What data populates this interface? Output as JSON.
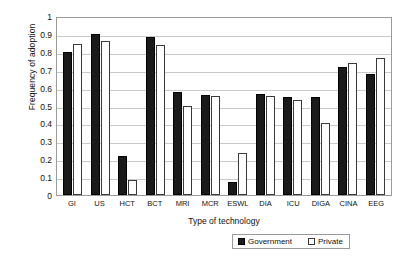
{
  "chart_data": {
    "type": "bar",
    "title": "",
    "xlabel": "Type of technology",
    "ylabel": "Frequency of adoption",
    "ylim": [
      0,
      1
    ],
    "ytick_labels": [
      "1",
      "0.9",
      "0.8",
      "0.7",
      "0.6",
      "0.5",
      "0.4",
      "0.3",
      "0.2",
      "0.1",
      "0"
    ],
    "ytick_values": [
      1,
      0.9,
      0.8,
      0.7,
      0.6,
      0.5,
      0.4,
      0.3,
      0.2,
      0.1,
      0
    ],
    "grid": true,
    "legend_position": "bottom-right",
    "categories": [
      "GI",
      "US",
      "HCT",
      "BCT",
      "MRI",
      "MCR",
      "ESWL",
      "DIA",
      "ICU",
      "DIGA",
      "CINA",
      "EEG"
    ],
    "series": [
      {
        "name": "Government",
        "color": "#1a1a1a",
        "values": [
          0.8,
          0.9,
          0.22,
          0.885,
          0.575,
          0.56,
          0.075,
          0.565,
          0.55,
          0.545,
          0.715,
          0.675
        ]
      },
      {
        "name": "Private",
        "color": "#ffffff",
        "values": [
          0.845,
          0.86,
          0.085,
          0.84,
          0.5,
          0.555,
          0.235,
          0.555,
          0.53,
          0.405,
          0.735,
          0.765
        ]
      }
    ]
  }
}
